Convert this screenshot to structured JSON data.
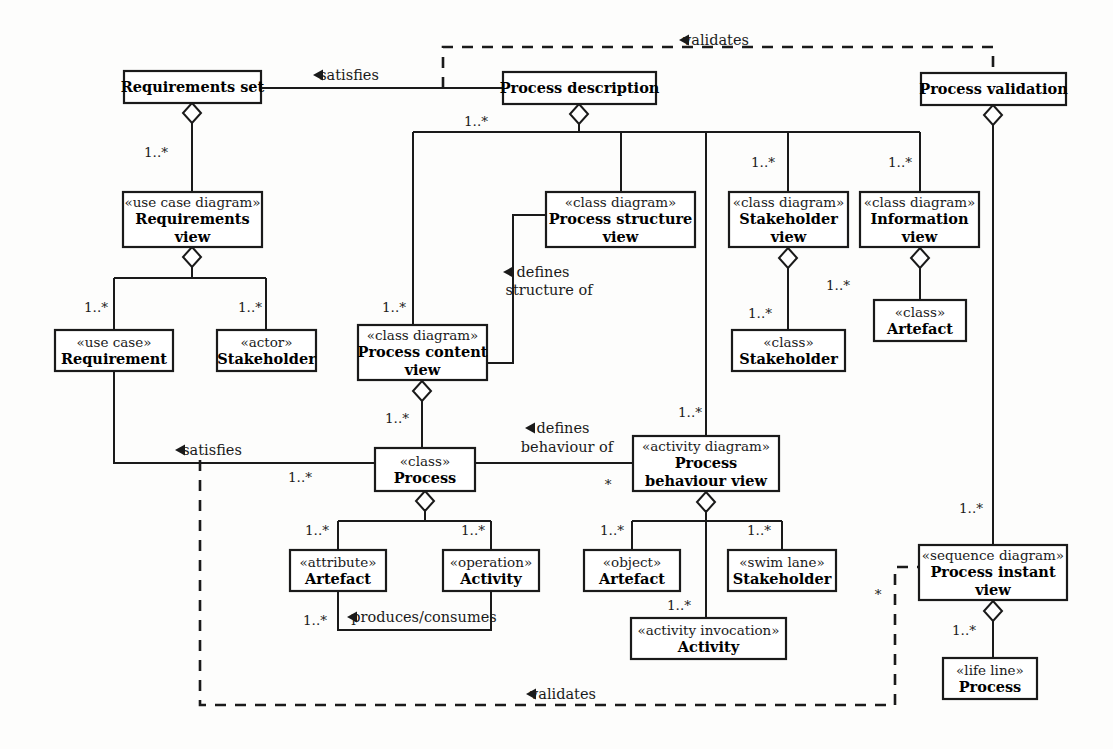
{
  "diagram": {
    "type": "uml-class-diagram",
    "colors": {
      "stroke": "#1a1a1a",
      "fill": "#ffffff",
      "background": "#fdfdfc"
    },
    "boxes": [
      {
        "id": "requirements-set",
        "stereotype": "",
        "name": "Requirements set",
        "name2": "",
        "x": 124,
        "y": 71,
        "w": 137,
        "h": 32
      },
      {
        "id": "process-description",
        "stereotype": "",
        "name": "Process description",
        "name2": "",
        "x": 503,
        "y": 72,
        "w": 153,
        "h": 32
      },
      {
        "id": "process-validation",
        "stereotype": "",
        "name": "Process validation",
        "name2": "",
        "x": 921,
        "y": 73,
        "w": 145,
        "h": 32
      },
      {
        "id": "requirements-view",
        "stereotype": "«use case diagram»",
        "name": "Requirements",
        "name2": "view",
        "x": 123,
        "y": 192,
        "w": 139,
        "h": 55
      },
      {
        "id": "process-structure-view",
        "stereotype": "«class diagram»",
        "name": "Process structure",
        "name2": "view",
        "x": 546,
        "y": 192,
        "w": 149,
        "h": 55
      },
      {
        "id": "stakeholder-view",
        "stereotype": "«class diagram»",
        "name": "Stakeholder",
        "name2": "view",
        "x": 729,
        "y": 192,
        "w": 119,
        "h": 55
      },
      {
        "id": "information-view",
        "stereotype": "«class diagram»",
        "name": "Information",
        "name2": "view",
        "x": 860,
        "y": 192,
        "w": 119,
        "h": 55
      },
      {
        "id": "artefact-class",
        "stereotype": "«class»",
        "name": "Artefact",
        "name2": "",
        "x": 874,
        "y": 300,
        "w": 92,
        "h": 41
      },
      {
        "id": "stakeholder-class",
        "stereotype": "«class»",
        "name": "Stakeholder",
        "name2": "",
        "x": 732,
        "y": 330,
        "w": 113,
        "h": 41
      },
      {
        "id": "requirement",
        "stereotype": "«use case»",
        "name": "Requirement",
        "name2": "",
        "x": 55,
        "y": 330,
        "w": 118,
        "h": 41
      },
      {
        "id": "stakeholder-actor",
        "stereotype": "«actor»",
        "name": "Stakeholder",
        "name2": "",
        "x": 217,
        "y": 330,
        "w": 99,
        "h": 41
      },
      {
        "id": "process-content-view",
        "stereotype": "«class diagram»",
        "name": "Process content",
        "name2": "view",
        "x": 358,
        "y": 325,
        "w": 129,
        "h": 55
      },
      {
        "id": "process-class",
        "stereotype": "«class»",
        "name": "Process",
        "name2": "",
        "x": 375,
        "y": 448,
        "w": 100,
        "h": 43
      },
      {
        "id": "process-behaviour-view",
        "stereotype": "«activity diagram»",
        "name": "Process",
        "name2": "behaviour view",
        "x": 633,
        "y": 436,
        "w": 146,
        "h": 55
      },
      {
        "id": "artefact-attribute",
        "stereotype": "«attribute»",
        "name": "Artefact",
        "name2": "",
        "x": 290,
        "y": 550,
        "w": 96,
        "h": 41
      },
      {
        "id": "activity-operation",
        "stereotype": "«operation»",
        "name": "Activity",
        "name2": "",
        "x": 443,
        "y": 550,
        "w": 96,
        "h": 41
      },
      {
        "id": "artefact-object",
        "stereotype": "«object»",
        "name": "Artefact",
        "name2": "",
        "x": 584,
        "y": 550,
        "w": 96,
        "h": 41
      },
      {
        "id": "stakeholder-swimlane",
        "stereotype": "«swim lane»",
        "name": "Stakeholder",
        "name2": "",
        "x": 728,
        "y": 550,
        "w": 108,
        "h": 41
      },
      {
        "id": "activity-invocation",
        "stereotype": "«activity invocation»",
        "name": "Activity",
        "name2": "",
        "x": 631,
        "y": 618,
        "w": 155,
        "h": 41
      },
      {
        "id": "process-instant-view",
        "stereotype": "«sequence diagram»",
        "name": "Process instant",
        "name2": "view",
        "x": 919,
        "y": 545,
        "w": 148,
        "h": 55
      },
      {
        "id": "process-lifeline",
        "stereotype": "«life line»",
        "name": "Process",
        "name2": "",
        "x": 943,
        "y": 658,
        "w": 94,
        "h": 41
      }
    ],
    "edge_labels": [
      {
        "id": "satisfies-top",
        "text": "satisfies",
        "x": 349,
        "y": 75,
        "arrow": "left",
        "arrow_x": 313,
        "arrow_y": 70
      },
      {
        "id": "validates-top",
        "text": "validates",
        "x": 716,
        "y": 40,
        "arrow": "left",
        "arrow_x": 679,
        "arrow_y": 35
      },
      {
        "id": "defines-structure-1",
        "text": "defines",
        "x": 543,
        "y": 272,
        "arrow": "left",
        "arrow_x": 503,
        "arrow_y": 267
      },
      {
        "id": "defines-structure-2",
        "text": "structure of",
        "x": 549,
        "y": 290,
        "arrow": "none",
        "arrow_x": 0,
        "arrow_y": 0
      },
      {
        "id": "defines-behaviour-1",
        "text": "defines",
        "x": 563,
        "y": 428,
        "arrow": "left",
        "arrow_x": 525,
        "arrow_y": 423
      },
      {
        "id": "defines-behaviour-2",
        "text": "behaviour of",
        "x": 567,
        "y": 447,
        "arrow": "none",
        "arrow_x": 0,
        "arrow_y": 0
      },
      {
        "id": "satisfies-mid",
        "text": "satisfies",
        "x": 212,
        "y": 450,
        "arrow": "left",
        "arrow_x": 175,
        "arrow_y": 445
      },
      {
        "id": "produces-consumes",
        "text": "produces/consumes",
        "x": 424,
        "y": 617,
        "arrow": "left",
        "arrow_x": 347,
        "arrow_y": 612
      },
      {
        "id": "validates-bottom",
        "text": "validates",
        "x": 563,
        "y": 694,
        "arrow": "left",
        "arrow_x": 526,
        "arrow_y": 689
      }
    ],
    "multiplicities": [
      {
        "id": "m-reqset-reqview",
        "text": "1..*",
        "x": 156,
        "y": 152
      },
      {
        "id": "m-procdesc-content",
        "text": "1..*",
        "x": 476,
        "y": 121
      },
      {
        "id": "m-procdesc-stakeview",
        "text": "1..*",
        "x": 763,
        "y": 162
      },
      {
        "id": "m-procdesc-infoview",
        "text": "1..*",
        "x": 900,
        "y": 162
      },
      {
        "id": "m-reqview-requirement",
        "text": "1..*",
        "x": 96,
        "y": 307
      },
      {
        "id": "m-reqview-stakeholder",
        "text": "1..*",
        "x": 250,
        "y": 307
      },
      {
        "id": "m-content-view",
        "text": "1..*",
        "x": 394,
        "y": 307
      },
      {
        "id": "m-stakeview-class",
        "text": "1..*",
        "x": 760,
        "y": 313
      },
      {
        "id": "m-infoview-artefact",
        "text": "1..*",
        "x": 838,
        "y": 285
      },
      {
        "id": "m-content-process",
        "text": "1..*",
        "x": 397,
        "y": 418
      },
      {
        "id": "m-procdesc-behaviour",
        "text": "1..*",
        "x": 690,
        "y": 412
      },
      {
        "id": "m-requirement-process",
        "text": "1..*",
        "x": 300,
        "y": 477
      },
      {
        "id": "m-behaviour-star",
        "text": "*",
        "x": 608,
        "y": 484
      },
      {
        "id": "m-process-attribute",
        "text": "1..*",
        "x": 317,
        "y": 530
      },
      {
        "id": "m-process-operation",
        "text": "1..*",
        "x": 473,
        "y": 530
      },
      {
        "id": "m-behaviour-object",
        "text": "1..*",
        "x": 612,
        "y": 530
      },
      {
        "id": "m-behaviour-swimlane",
        "text": "1..*",
        "x": 759,
        "y": 530
      },
      {
        "id": "m-attribute-produces",
        "text": "1..*",
        "x": 315,
        "y": 620
      },
      {
        "id": "m-behaviour-invocation",
        "text": "1..*",
        "x": 679,
        "y": 605
      },
      {
        "id": "m-validation-instant",
        "text": "1..*",
        "x": 971,
        "y": 508
      },
      {
        "id": "m-instant-lifeline",
        "text": "1..*",
        "x": 964,
        "y": 630
      },
      {
        "id": "m-instant-star",
        "text": "*",
        "x": 878,
        "y": 594
      }
    ]
  }
}
